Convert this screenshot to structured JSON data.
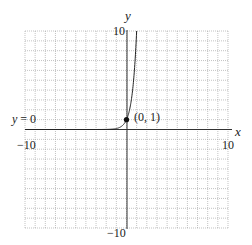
{
  "chart_data": {
    "type": "line",
    "title": "",
    "function": "y = 10^x",
    "xlabel": "x",
    "ylabel": "y",
    "xlim": [
      -10,
      10
    ],
    "ylim": [
      -10,
      10
    ],
    "grid": true,
    "grid_step": 1,
    "tick_labels": {
      "x_min": "−10",
      "x_max": "10",
      "y_min": "−10",
      "y_max": "10"
    },
    "series": [
      {
        "name": "exponential curve",
        "x": [
          -10,
          -3,
          -2,
          -1,
          -0.5,
          0,
          0.5,
          0.8,
          1
        ],
        "y": [
          0,
          0.001,
          0.01,
          0.1,
          0.316,
          1,
          3.16,
          6.31,
          10
        ]
      }
    ],
    "points": [
      {
        "x": 0,
        "y": 1,
        "label": "(0, 1)"
      }
    ],
    "annotations": [
      {
        "text": "y = 0",
        "meaning": "horizontal asymptote",
        "position": "left of x-axis"
      }
    ]
  },
  "labels": {
    "x_axis": "x",
    "y_axis": "y",
    "x_min": "−10",
    "x_max": "10",
    "y_min": "−10",
    "y_max": "10",
    "point": "(0, 1)",
    "asymptote_y": "y",
    "asymptote_rest": " = 0"
  },
  "colors": {
    "grid": "#9a9a9a",
    "axis": "#333333",
    "curve": "#222222",
    "point": "#111111"
  }
}
